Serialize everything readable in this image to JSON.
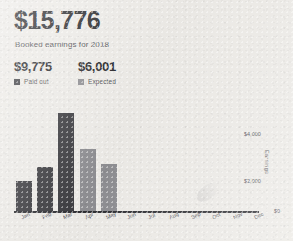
{
  "header": {
    "total": "$15,776",
    "subtitle": "Booked earnings for 2018"
  },
  "legend": {
    "items": [
      {
        "value": "$9,775",
        "label": "Paid out",
        "color": "#3a3a3e",
        "swatch": "paid-out-swatch"
      },
      {
        "value": "$6,001",
        "label": "Expected",
        "color": "#8e8e92",
        "swatch": "expected-swatch"
      }
    ]
  },
  "chart_data": {
    "type": "bar",
    "title": "Booked earnings for 2018",
    "xlabel": "",
    "ylabel": "Earnings",
    "ylim": [
      0,
      5000
    ],
    "grid": false,
    "legend_position": "top-left",
    "categories": [
      "Jan",
      "Feb",
      "Mar",
      "Apr",
      "May",
      "Jun",
      "Jul",
      "Aug",
      "Sep",
      "Oct",
      "Nov",
      "Dec"
    ],
    "ytick_labels": [
      "$0",
      "$2,000",
      "$4,000"
    ],
    "ytick_values": [
      0,
      2000,
      4000
    ],
    "series": [
      {
        "name": "Paid out",
        "color": "#3a3a3e",
        "values": [
          1450,
          2100,
          4600,
          null,
          null,
          null,
          null,
          null,
          null,
          null,
          null,
          null
        ]
      },
      {
        "name": "Expected",
        "color": "#8e8e92",
        "values": [
          null,
          null,
          null,
          2900,
          2200,
          null,
          null,
          null,
          null,
          null,
          null,
          null
        ]
      }
    ],
    "totals": {
      "paid_out": 9775,
      "expected": 6001,
      "booked": 15776
    }
  }
}
